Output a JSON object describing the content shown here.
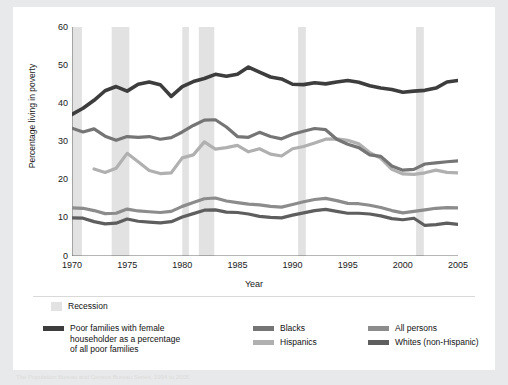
{
  "figure": {
    "background": "#ffffff",
    "page_background": "#e8e9ea"
  },
  "axis": {
    "ylabel": "Percentage living in poverty",
    "xlabel": "Year",
    "yticks": [
      "0",
      "10",
      "20",
      "30",
      "40",
      "50",
      "60"
    ],
    "xticks": [
      "1970",
      "1975",
      "1980",
      "1985",
      "1990",
      "1995",
      "2000",
      "2005"
    ]
  },
  "legend": {
    "recession_label": "Recession",
    "recession_color": "#e2e2e2",
    "items": [
      {
        "label": "Poor families with female\nhouseholder as a percentage\nof all poor families",
        "color": "#3d3d3d"
      },
      {
        "label": "Blacks",
        "color": "#757575"
      },
      {
        "label": "All persons",
        "color": "#8c8c8c"
      },
      {
        "label": "Hispanics",
        "color": "#b0b0b0"
      },
      {
        "label": "Whites (non-Hispanic)",
        "color": "#5e5e5e"
      }
    ]
  },
  "footnote": "The Population Bureau and Census Bureau Series, 1994 to 2005",
  "chart_data": {
    "type": "line",
    "title": "",
    "xlabel": "Year",
    "ylabel": "Percentage living in poverty",
    "xlim": [
      1970,
      2005
    ],
    "ylim": [
      0,
      60
    ],
    "grid": false,
    "legend_position": "below",
    "x": [
      1970,
      1971,
      1972,
      1973,
      1974,
      1975,
      1976,
      1977,
      1978,
      1979,
      1980,
      1981,
      1982,
      1983,
      1984,
      1985,
      1986,
      1987,
      1988,
      1989,
      1990,
      1991,
      1992,
      1993,
      1994,
      1995,
      1996,
      1997,
      1998,
      1999,
      2000,
      2001,
      2002,
      2003,
      2004,
      2005
    ],
    "recessions": [
      {
        "start": 1969.9,
        "end": 1970.9
      },
      {
        "start": 1973.6,
        "end": 1975.2
      },
      {
        "start": 1980.0,
        "end": 1980.6
      },
      {
        "start": 1981.5,
        "end": 1982.9
      },
      {
        "start": 1990.5,
        "end": 1991.2
      },
      {
        "start": 2001.2,
        "end": 2001.9
      }
    ],
    "series": [
      {
        "name": "Poor families with female householder as a percentage of all poor families",
        "color": "#3d3d3d",
        "width": 3.6,
        "values": [
          37.1,
          38.7,
          40.8,
          43.3,
          44.4,
          43.2,
          45.0,
          45.6,
          44.9,
          41.8,
          44.4,
          45.7,
          46.5,
          47.6,
          47.1,
          47.6,
          49.5,
          48.2,
          46.9,
          46.4,
          45.0,
          44.9,
          45.4,
          45.1,
          45.6,
          46.0,
          45.5,
          44.6,
          44.0,
          43.6,
          42.9,
          43.2,
          43.4,
          44.0,
          45.6,
          46.0
        ]
      },
      {
        "name": "Blacks",
        "color": "#757575",
        "width": 3.2,
        "values": [
          33.5,
          32.5,
          33.3,
          31.4,
          30.3,
          31.3,
          31.1,
          31.3,
          30.6,
          31.0,
          32.5,
          34.2,
          35.6,
          35.7,
          33.8,
          31.3,
          31.1,
          32.4,
          31.3,
          30.7,
          31.9,
          32.7,
          33.4,
          33.1,
          30.6,
          29.3,
          28.4,
          26.5,
          26.1,
          23.6,
          22.5,
          22.7,
          24.1,
          24.4,
          24.7,
          24.9
        ]
      },
      {
        "name": "Hispanics",
        "color": "#b0b0b0",
        "width": 3.2,
        "values": [
          null,
          null,
          22.8,
          21.9,
          23.0,
          26.9,
          24.7,
          22.4,
          21.6,
          21.8,
          25.7,
          26.5,
          29.9,
          28.0,
          28.4,
          29.0,
          27.3,
          28.1,
          26.7,
          26.2,
          28.1,
          28.7,
          29.6,
          30.6,
          30.7,
          30.3,
          29.4,
          27.1,
          25.6,
          22.7,
          21.5,
          21.4,
          21.8,
          22.5,
          21.9,
          21.8
        ]
      },
      {
        "name": "All persons",
        "color": "#8c8c8c",
        "width": 3.2,
        "values": [
          12.6,
          12.5,
          11.9,
          11.1,
          11.2,
          12.3,
          11.8,
          11.6,
          11.4,
          11.7,
          13.0,
          14.0,
          15.0,
          15.2,
          14.4,
          14.0,
          13.6,
          13.4,
          13.0,
          12.8,
          13.5,
          14.2,
          14.8,
          15.1,
          14.5,
          13.8,
          13.7,
          13.3,
          12.7,
          11.9,
          11.3,
          11.7,
          12.1,
          12.5,
          12.7,
          12.6
        ]
      },
      {
        "name": "Whites (non-Hispanic)",
        "color": "#5e5e5e",
        "width": 3.2,
        "values": [
          10.0,
          9.9,
          9.0,
          8.4,
          8.6,
          9.7,
          9.1,
          8.9,
          8.7,
          9.0,
          10.2,
          11.1,
          12.0,
          12.1,
          11.5,
          11.4,
          11.0,
          10.4,
          10.1,
          10.0,
          10.7,
          11.3,
          11.9,
          12.2,
          11.7,
          11.2,
          11.2,
          11.0,
          10.5,
          9.8,
          9.5,
          9.9,
          8.0,
          8.2,
          8.6,
          8.3
        ]
      }
    ]
  }
}
